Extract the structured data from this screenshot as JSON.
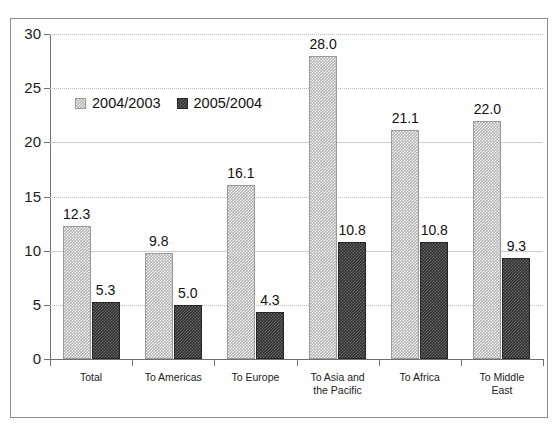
{
  "top_cut_text": "",
  "chart_data": {
    "type": "bar",
    "title": "",
    "xlabel": "",
    "ylabel": "",
    "ylim": [
      0,
      30
    ],
    "yticks": [
      0,
      5,
      10,
      15,
      20,
      25,
      30
    ],
    "ytick_labels": [
      "0",
      "5",
      "10",
      "15",
      "20",
      "25",
      "30"
    ],
    "grid": true,
    "legend_position": "upper-left-inside",
    "categories": [
      "Total",
      "To Americas",
      "To Europe",
      "To Asia and\nthe Pacific",
      "To Africa",
      "To Middle\nEast"
    ],
    "series": [
      {
        "name": "2004/2003",
        "swatch_color": "#b0b0b0",
        "values": [
          12.3,
          9.8,
          16.1,
          28.0,
          21.1,
          22.0
        ],
        "value_labels": [
          "12.3",
          "9.8",
          "16.1",
          "28.0",
          "21.1",
          "22.0"
        ]
      },
      {
        "name": "2005/2004",
        "swatch_color": "#2f2f2f",
        "values": [
          5.3,
          5.0,
          4.3,
          10.8,
          10.8,
          9.3
        ],
        "value_labels": [
          "5.3",
          "5.0",
          "4.3",
          "10.8",
          "10.8",
          "9.3"
        ]
      }
    ]
  }
}
